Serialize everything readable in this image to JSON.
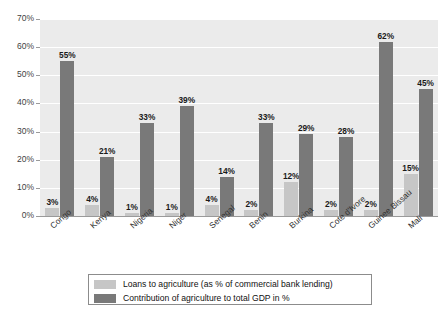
{
  "chart_data": {
    "type": "bar",
    "title": "",
    "xlabel": "",
    "ylabel": "",
    "ylim": [
      0,
      70
    ],
    "ytick_labels": [
      "0%",
      "10%",
      "20%",
      "30%",
      "40%",
      "50%",
      "60%",
      "70%"
    ],
    "ytick_values": [
      0,
      10,
      20,
      30,
      40,
      50,
      60,
      70
    ],
    "grid": true,
    "legend_position": "below",
    "categories": [
      "Congo",
      "Kenya",
      "Nigeria",
      "Niger",
      "Senegal",
      "Benin",
      "Burkina",
      "Cote d'Ivore",
      "Guinee Bissau",
      "Mali"
    ],
    "series": [
      {
        "name": "Loans to agriculture (as % of commercial bank lending)",
        "color": "#c6c6c6",
        "values": [
          3,
          4,
          1,
          1,
          4,
          2,
          12,
          2,
          2,
          15
        ],
        "data_labels": [
          "3%",
          "4%",
          "1%",
          "1%",
          "4%",
          "2%",
          "12%",
          "2%",
          "2%",
          "15%"
        ]
      },
      {
        "name": "Contribution of agriculture to total GDP in %",
        "color": "#797979",
        "values": [
          55,
          21,
          33,
          39,
          14,
          33,
          29,
          28,
          62,
          45
        ],
        "data_labels": [
          "55%",
          "21%",
          "33%",
          "39%",
          "14%",
          "33%",
          "29%",
          "28%",
          "62%",
          "45%"
        ]
      }
    ]
  },
  "colors": {
    "plot_background": "#ebebeb",
    "gridline": "#ffffff",
    "axis": "#9a9a9a",
    "series_light": "#c6c6c6",
    "series_dark": "#797979",
    "text": "#333333"
  },
  "legend": {
    "items": [
      {
        "label": "Loans to agriculture (as % of commercial bank lending)",
        "swatch": "light"
      },
      {
        "label": "Contribution of agriculture to total GDP in %",
        "swatch": "dark"
      }
    ]
  }
}
